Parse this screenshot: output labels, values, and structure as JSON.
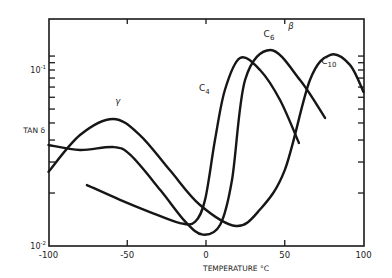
{
  "chart_data": {
    "type": "line",
    "title": "",
    "xlabel": "TEMPERATURE °C",
    "ylabel": "TAN δ",
    "xlim": [
      -100,
      100
    ],
    "ylim": [
      0.01,
      0.19
    ],
    "yscale": "log",
    "xticks": [
      -100,
      -50,
      0,
      50,
      100
    ],
    "xtick_labels": [
      "-100",
      "-50",
      "0",
      "50",
      "100"
    ],
    "ytick_labels": [
      {
        "value": 0.1,
        "base": "10",
        "exp": "-1"
      },
      {
        "value": 0.01,
        "base": "10",
        "exp": "-2"
      }
    ],
    "ytick_minor": [
      0.02,
      0.03,
      0.04,
      0.05,
      0.06,
      0.07,
      0.08,
      0.09,
      0.1,
      0.11,
      0.12
    ],
    "grid": false,
    "legend": "none (inline curve labels)",
    "annotations": [
      {
        "text": "γ",
        "x": -56,
        "y": 0.064
      },
      {
        "text": "β",
        "x": 54,
        "y": 0.17
      },
      {
        "text": "C",
        "sub": "4",
        "x": -1,
        "y": 0.076
      },
      {
        "text": "C",
        "sub": "6",
        "x": 40,
        "y": 0.155
      },
      {
        "text": "C",
        "sub": "10",
        "x": 78,
        "y": 0.108
      }
    ],
    "series": [
      {
        "name": "C4",
        "x": [
          -75.6,
          -54.6,
          -35.6,
          -16.5,
          -7,
          -0.6,
          5.7,
          12,
          21.6,
          34.3,
          47,
          59
        ],
        "y": [
          0.0222,
          0.0183,
          0.0156,
          0.0135,
          0.0137,
          0.0183,
          0.04,
          0.077,
          0.117,
          0.1,
          0.0675,
          0.0385
        ]
      },
      {
        "name": "C6",
        "x": [
          -100,
          -80,
          -59,
          -48,
          -29,
          -13,
          -2,
          9,
          16.5,
          24.8,
          41,
          59.7,
          75.6
        ],
        "y": [
          0.0375,
          0.0351,
          0.0365,
          0.0329,
          0.0208,
          0.0137,
          0.0116,
          0.0132,
          0.0237,
          0.0877,
          0.13,
          0.0877,
          0.0534
        ]
      },
      {
        "name": "C10",
        "x": [
          -100,
          -80,
          -59,
          -42,
          -23,
          -3.8,
          19,
          34,
          50,
          66,
          79,
          91.4,
          100
        ],
        "y": [
          0.0264,
          0.0427,
          0.0527,
          0.0427,
          0.027,
          0.0171,
          0.013,
          0.016,
          0.027,
          0.0877,
          0.122,
          0.107,
          0.075
        ]
      }
    ]
  }
}
